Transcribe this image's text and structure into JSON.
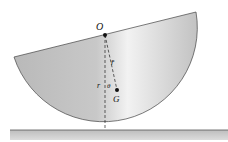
{
  "diagram": {
    "labels": {
      "origin": "O",
      "rbar": "r̄",
      "r": "r",
      "theta": "θ",
      "center_of_mass": "G"
    },
    "colors": {
      "body_fill": "#c4c4c4",
      "body_light": "#efefef",
      "ground_fill": "#a8a8a8",
      "stroke": "#333333"
    }
  }
}
